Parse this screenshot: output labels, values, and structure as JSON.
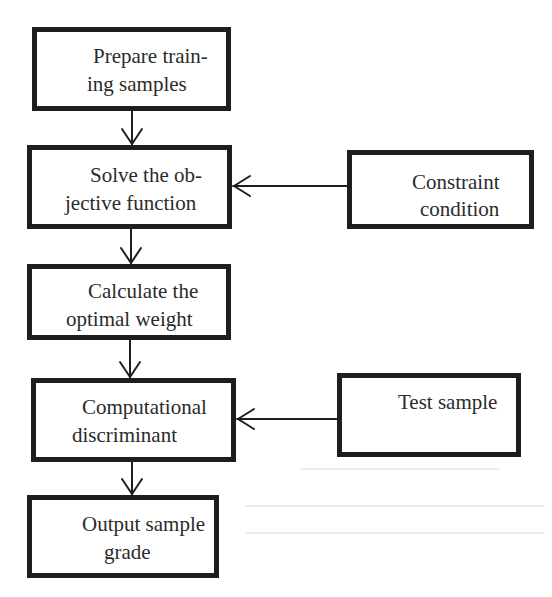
{
  "diagram": {
    "type": "flowchart",
    "nodes": [
      {
        "id": "prepare",
        "line1": "Prepare train-",
        "line2": "ing samples"
      },
      {
        "id": "solve",
        "line1": "Solve the ob-",
        "line2": "jective function"
      },
      {
        "id": "calculate",
        "line1": "Calculate the",
        "line2": "optimal weight"
      },
      {
        "id": "discriminant",
        "line1": "Computational",
        "line2": "discriminant"
      },
      {
        "id": "output",
        "line1": "Output sample",
        "line2": "grade"
      },
      {
        "id": "constraint",
        "line1": "Constraint",
        "line2": "condition"
      },
      {
        "id": "test",
        "line1": "Test sample",
        "line2": ""
      }
    ],
    "edges": [
      {
        "from": "prepare",
        "to": "solve",
        "icon": "arrow-down-icon"
      },
      {
        "from": "solve",
        "to": "calculate",
        "icon": "arrow-down-icon"
      },
      {
        "from": "calculate",
        "to": "discriminant",
        "icon": "arrow-down-icon"
      },
      {
        "from": "discriminant",
        "to": "output",
        "icon": "arrow-down-icon"
      },
      {
        "from": "constraint",
        "to": "solve",
        "icon": "arrow-left-icon"
      },
      {
        "from": "test",
        "to": "discriminant",
        "icon": "arrow-left-icon"
      }
    ],
    "colors": {
      "border": "#1e1e1e",
      "text": "#2b2b2b",
      "background": "#ffffff"
    }
  }
}
